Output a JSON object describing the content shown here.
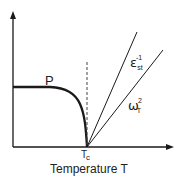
{
  "diagram": {
    "type": "phase-transition-sketch",
    "x_axis_label": "Temperature T",
    "critical_point_label": {
      "base": "T",
      "subscript": "c"
    },
    "curves": [
      {
        "id": "polarization",
        "label": "P",
        "description": "order parameter, flat then drops to zero at Tc"
      },
      {
        "id": "inverse-static-permittivity",
        "label": {
          "base": "ε",
          "subscript": "st",
          "superscript": "-1"
        },
        "description": "linear increase above Tc (steeper)"
      },
      {
        "id": "soft-mode-frequency-squared",
        "label": {
          "base": "ω",
          "subscript": "T",
          "superscript": "2"
        },
        "description": "linear increase above Tc"
      }
    ],
    "vertical_marker": "dashed line at Tc",
    "colors": {
      "line": "#1a1a1a",
      "background": "#ffffff"
    }
  }
}
